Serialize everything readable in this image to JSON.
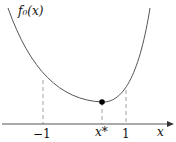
{
  "diagram": {
    "function_label": "f₀(x)",
    "x_axis_label": "x",
    "ticks": [
      {
        "label": "−1",
        "value": -1
      },
      {
        "label": "x*",
        "value": "x*"
      },
      {
        "label": "1",
        "value": 1
      }
    ],
    "minimizer_label": "x*",
    "colors": {
      "curve": "#555555",
      "axis": "#555555",
      "dashed": "#888888",
      "point": "#000000"
    }
  }
}
